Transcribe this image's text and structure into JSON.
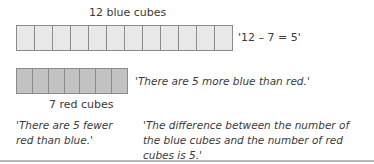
{
  "blue_row": {
    "label": "12 blue cubes",
    "count": 12,
    "fill_color": "#e8e8e8",
    "equation": "'12 – 7 = 5'"
  },
  "red_row": {
    "label": "7 red cubes",
    "count": 7,
    "fill_color": "#c2c2c2",
    "statement": "'There are 5 more blue than red.'"
  },
  "statements": {
    "fewer": "'There are 5 fewer red than blue.'",
    "difference": "'The difference between the number of the blue cubes and the number of red cubes is 5.'"
  }
}
